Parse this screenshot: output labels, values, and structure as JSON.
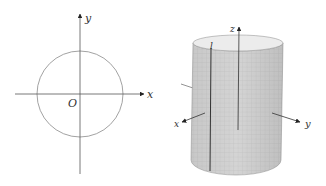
{
  "left_figure": {
    "type": "circle-on-axes",
    "x_axis_label": "x",
    "y_axis_label": "y",
    "origin_label": "O",
    "circle": {
      "center": [
        80,
        94
      ],
      "radius": 43
    }
  },
  "right_figure": {
    "type": "cylinder-3d",
    "x_axis_label": "x",
    "y_axis_label": "y",
    "z_axis_label": "z",
    "line_label": "l"
  },
  "colors": {
    "axis": "#555555",
    "circle": "#888888",
    "cylinder_fill": "#d6d6d6",
    "cylinder_grid": "#b8b8b8",
    "cylinder_top": "#eeeeee",
    "line": "#333333"
  }
}
